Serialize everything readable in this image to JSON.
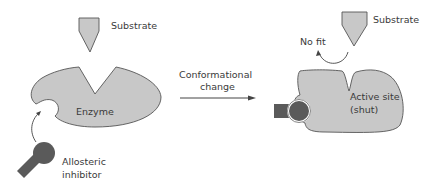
{
  "diagram": {
    "left_panel": {
      "substrate_label": "Substrate",
      "enzyme_label": "Enzyme",
      "inhibitor_label_line1": "Allosteric",
      "inhibitor_label_line2": "inhibitor"
    },
    "transition": {
      "label_line1": "Conformational",
      "label_line2": "change"
    },
    "right_panel": {
      "substrate_label": "Substrate",
      "no_fit_label": "No fit",
      "active_site_line1": "Active site",
      "active_site_line2": "(shut)"
    },
    "colors": {
      "enzyme_fill": "#c8c8c8",
      "outline": "#555555",
      "inhibitor_fill": "#5a5a5a",
      "text": "#3a3a3a"
    }
  }
}
